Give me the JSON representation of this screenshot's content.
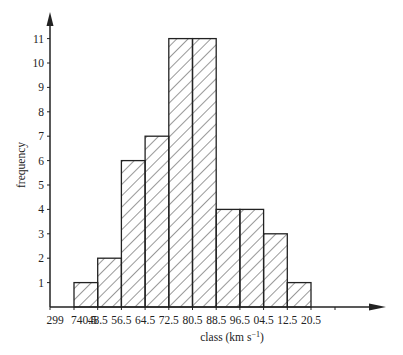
{
  "chart_data": {
    "type": "bar",
    "title": "",
    "xlabel": "class (km s⁻¹)",
    "ylabel": "frequency",
    "categories": [
      "740.5-748.5",
      "748.5-756.5",
      "756.5-764.5",
      "764.5-772.5",
      "772.5-780.5",
      "780.5-788.5",
      "788.5-796.5",
      "796.5-804.5",
      "804.5-812.5",
      "812.5-820.5"
    ],
    "values": [
      1,
      2,
      6,
      7,
      11,
      11,
      4,
      4,
      3,
      1
    ],
    "x_tick_labels": [
      "299",
      "740.5",
      "48.5",
      "56.5",
      "64.5",
      "72.5",
      "80.5",
      "88.5",
      "96.5",
      "04.5",
      "12.5",
      "20.5"
    ],
    "y_tick_labels": [
      "1",
      "2",
      "3",
      "4",
      "5",
      "6",
      "7",
      "8",
      "9",
      "10",
      "11"
    ],
    "ylim": [
      0,
      12
    ],
    "grid": false,
    "legend": null,
    "bar_fill": "diagonal hatch",
    "colors": {
      "stroke": "#222222",
      "background": "#ffffff"
    }
  }
}
